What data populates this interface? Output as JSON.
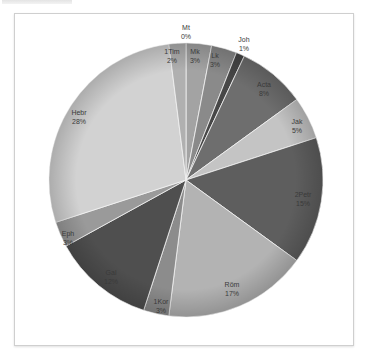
{
  "chart_data": {
    "type": "pie",
    "title": "",
    "start_angle_deg": 0,
    "direction": "clockwise",
    "slices": [
      {
        "label": "Mt",
        "value": 0,
        "display": "0%",
        "color": "#5a5a5a"
      },
      {
        "label": "Mk",
        "value": 3,
        "display": "3%",
        "color": "#a3a3a3"
      },
      {
        "label": "Lk",
        "value": 3,
        "display": "3%",
        "color": "#8a8a8a"
      },
      {
        "label": "Joh",
        "value": 1,
        "display": "1%",
        "color": "#474747"
      },
      {
        "label": "Acta",
        "value": 8,
        "display": "8%",
        "color": "#6e6e6e"
      },
      {
        "label": "Jak",
        "value": 5,
        "display": "5%",
        "color": "#c4c4c4"
      },
      {
        "label": "2Petr",
        "value": 15,
        "display": "15%",
        "color": "#5e5e5e"
      },
      {
        "label": "Röm",
        "value": 17,
        "display": "17%",
        "color": "#b3b3b3"
      },
      {
        "label": "1Kor",
        "value": 3,
        "display": "3%",
        "color": "#8c8c8c"
      },
      {
        "label": "Gal",
        "value": 12,
        "display": "12%",
        "color": "#4f4f4f"
      },
      {
        "label": "Eph",
        "value": 3,
        "display": "3%",
        "color": "#9a9a9a"
      },
      {
        "label": "Hebr",
        "value": 28,
        "display": "28%",
        "color": "#d2d2d2"
      },
      {
        "label": "1Tim",
        "value": 2,
        "display": "2%",
        "color": "#b0b0b0"
      }
    ],
    "legend": "none",
    "data_labels": "category name and percentage"
  }
}
